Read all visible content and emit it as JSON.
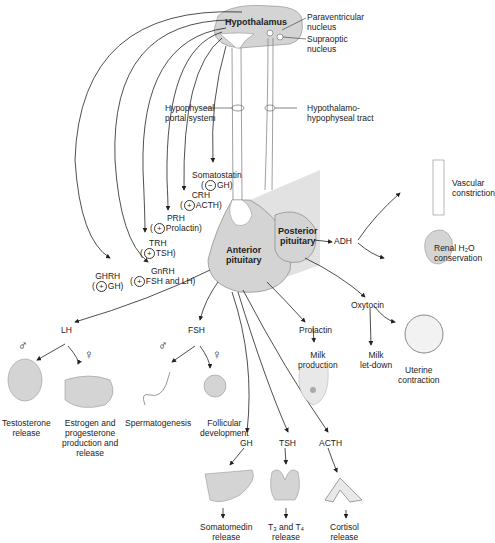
{
  "diagram": {
    "structures": {
      "hypothalamus": "Hypothalamus",
      "paraventricular": [
        "Paraventricular",
        "nucleus"
      ],
      "supraoptic": [
        "Supraoptic",
        "nucleus"
      ],
      "portal_system": [
        "Hypophyseal",
        "portal system"
      ],
      "hh_tract": [
        "Hypothalamo-",
        "hypophyseal tract"
      ],
      "anterior": [
        "Anterior",
        "pituitary"
      ],
      "posterior": [
        "Posterior",
        "pituitary"
      ]
    },
    "releasing_hormones": [
      {
        "name": "Somatostatin",
        "sign": "−",
        "target": "GH)"
      },
      {
        "name": "CRH",
        "sign": "+",
        "target": "ACTH)"
      },
      {
        "name": "PRH",
        "sign": "+",
        "target": "Prolactin)"
      },
      {
        "name": "TRH",
        "sign": "+",
        "target": "TSH)"
      },
      {
        "name": "GnRH",
        "sign": "+",
        "target": "FSH and LH)"
      },
      {
        "name": "GHRH",
        "sign": "+",
        "target": "GH)"
      }
    ],
    "posterior_hormones": {
      "adh": "ADH",
      "oxytocin": "Oxytocin",
      "vascular": [
        "Vascular",
        "constriction"
      ],
      "renal": [
        "Renal H₂O",
        "conservation"
      ],
      "milk_letdown": [
        "Milk",
        "let-down"
      ],
      "uterine": [
        "Uterine",
        "contraction"
      ]
    },
    "anterior_hormones": {
      "lh": "LH",
      "fsh": "FSH",
      "prolactin": "Prolactin",
      "milk_production": [
        "Milk",
        "production"
      ],
      "gh": "GH",
      "tsh": "TSH",
      "acth": "ACTH"
    },
    "effects": {
      "testosterone": [
        "Testosterone",
        "release"
      ],
      "estrogen": [
        "Estrogen and",
        "progesterone",
        "production and",
        "release"
      ],
      "spermatogenesis": "Spermatogenesis",
      "follicular": [
        "Follicular",
        "development"
      ],
      "somatomedin": [
        "Somatomedin",
        "release"
      ],
      "t3t4": [
        "T₃ and T₄",
        "release"
      ],
      "cortisol": [
        "Cortisol",
        "release"
      ]
    },
    "symbols": {
      "male": "♂",
      "female": "♀",
      "open": "(",
      "close": ""
    },
    "colors": {
      "tissue": "#d4d4d4",
      "line": "#222222"
    }
  }
}
